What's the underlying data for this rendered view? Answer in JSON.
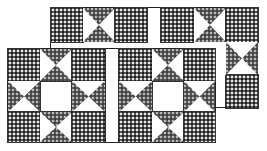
{
  "image": {
    "description": "Quilt pattern illustration: two overlapping rows of Ohio Star blocks with patterned fabric and white sashing strips",
    "colors": {
      "fabric_dark": "#5a5a5a",
      "fabric_light": "#e6e6e6",
      "background": "#ffffff",
      "outline": "#222222"
    }
  },
  "blocks": [
    {
      "name": "back-block",
      "x": 50,
      "y": 7,
      "w": 208,
      "h": 101,
      "cell": 32.5
    },
    {
      "name": "front-block",
      "x": 7,
      "y": 48,
      "w": 209,
      "h": 95,
      "cell": 32
    }
  ]
}
